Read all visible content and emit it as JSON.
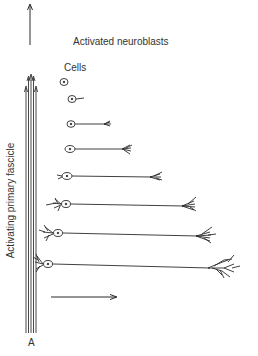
{
  "diagram": {
    "title": "Activated neuroblasts",
    "cells_label": "Cells",
    "axis_label": "Activating primary fascicle",
    "panel_label": "A",
    "icons": {
      "up_arrow": "arrow-up-icon",
      "right_arrow": "arrow-right-icon"
    },
    "colors": {
      "ink": "#2a2a2a",
      "background": "#ffffff"
    },
    "neurons": [
      {
        "x": 64,
        "y": 82,
        "axon_end": 64
      },
      {
        "x": 72,
        "y": 99,
        "axon_end": 84
      },
      {
        "x": 71,
        "y": 124,
        "axon_end": 112
      },
      {
        "x": 70,
        "y": 148,
        "axon_end": 135
      },
      {
        "x": 67,
        "y": 175,
        "axon_end": 170
      },
      {
        "x": 65,
        "y": 203,
        "axon_end": 200
      },
      {
        "x": 58,
        "y": 232,
        "axon_end": 215
      },
      {
        "x": 49,
        "y": 263,
        "axon_end": 225
      }
    ]
  }
}
